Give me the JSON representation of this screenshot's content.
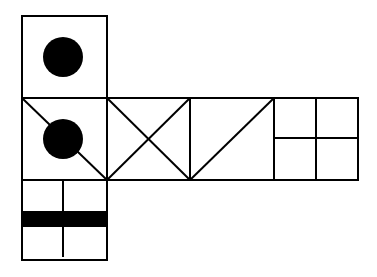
{
  "diagram": {
    "type": "cube-net",
    "colors": {
      "stroke": "#000000",
      "fill": "#000000",
      "background": "#ffffff"
    },
    "faces": [
      {
        "id": "top",
        "pattern": "centered-filled-circle"
      },
      {
        "id": "row-1",
        "pattern": "diagonal-line-with-filled-circle"
      },
      {
        "id": "row-2",
        "pattern": "x-cross"
      },
      {
        "id": "row-3",
        "pattern": "single-diagonal"
      },
      {
        "id": "row-4",
        "pattern": "four-quadrants"
      },
      {
        "id": "bottom",
        "pattern": "vertical-line-with-horizontal-black-bar"
      }
    ]
  }
}
